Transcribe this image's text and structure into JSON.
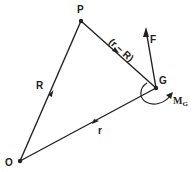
{
  "diagram": {
    "points": {
      "P": {
        "label": "P"
      },
      "G": {
        "label": "G"
      },
      "O": {
        "label": "O"
      }
    },
    "vectors": {
      "R": {
        "label": "R",
        "from": "O",
        "to": "P"
      },
      "r": {
        "label": "r",
        "from": "O",
        "to": "G"
      },
      "r_minus_R": {
        "label": "(r − R)",
        "from": "P",
        "to": "G"
      },
      "F": {
        "label": "F",
        "at": "G"
      }
    },
    "moment": {
      "label": "M",
      "subscript": "G"
    },
    "colors": {
      "line": "#222222",
      "background": "#ffffff"
    }
  }
}
